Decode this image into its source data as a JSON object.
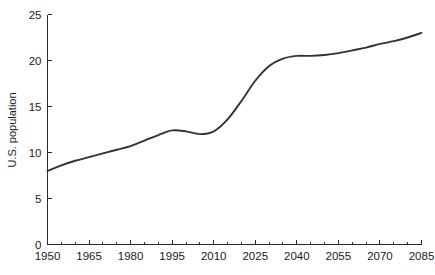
{
  "chart_data": {
    "type": "line",
    "title": "",
    "subtitle": "",
    "xlabel": "",
    "ylabel": "U.S. population",
    "xlim": [
      1950,
      2085
    ],
    "ylim": [
      0,
      25
    ],
    "grid": false,
    "legend": null,
    "x_ticks": [
      1950,
      1965,
      1980,
      1995,
      2010,
      2025,
      2040,
      2055,
      2070,
      2085
    ],
    "x_tick_labels": [
      "1950",
      "1965",
      "1980",
      "1995",
      "2010",
      "2025",
      "2040",
      "2055",
      "2070",
      "2085"
    ],
    "x_minor_tick_step": 5,
    "y_ticks": [
      0,
      5,
      10,
      15,
      20,
      25
    ],
    "y_tick_labels": [
      "0",
      "5",
      "10",
      "15",
      "20",
      "25"
    ],
    "line_color": "#333333",
    "axis_color": "#2b2b2b",
    "series": [
      {
        "name": "U.S. population",
        "x": [
          1950,
          1955,
          1960,
          1965,
          1970,
          1975,
          1980,
          1985,
          1990,
          1995,
          2000,
          2005,
          2010,
          2015,
          2020,
          2025,
          2030,
          2035,
          2040,
          2045,
          2050,
          2055,
          2060,
          2065,
          2070,
          2075,
          2080,
          2085
        ],
        "values": [
          8.0,
          8.6,
          9.1,
          9.5,
          9.9,
          10.3,
          10.7,
          11.3,
          11.9,
          12.4,
          12.3,
          12.0,
          12.3,
          13.6,
          15.6,
          17.8,
          19.4,
          20.2,
          20.5,
          20.5,
          20.6,
          20.8,
          21.1,
          21.4,
          21.8,
          22.1,
          22.5,
          23.0
        ]
      }
    ]
  },
  "axes": {
    "y_axis_title": "U.S. population"
  }
}
